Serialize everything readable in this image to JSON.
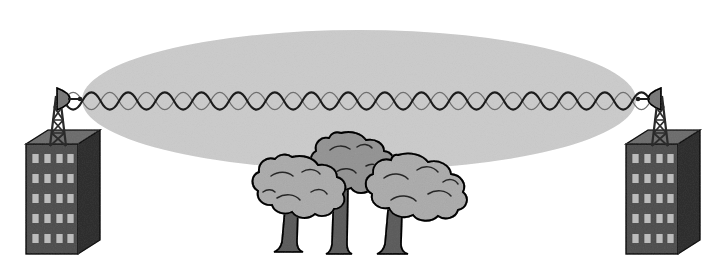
{
  "diagram": {
    "type": "technical-illustration",
    "canvas": {
      "width": 718,
      "height": 280,
      "background": "#ffffff"
    },
    "colors": {
      "background": "#ffffff",
      "fresnel_fill": "#e4e4e4",
      "building_front": "#8f8f8f",
      "building_side": "#6e6e6e",
      "building_top": "#a8a8a8",
      "building_outline": "#3a3a3a",
      "window_light": "#c9c9c9",
      "window_dark": "#5e5e5e",
      "tower_dark": "#2b2b2b",
      "tower_fill": "#8a8a8a",
      "dish_fill": "#b0b0b0",
      "wave_dark": "#1c1c1c",
      "wave_light": "#6f6f6f",
      "canopy_fill": "#d2d2d2",
      "canopy_fill_alt": "#c3c3c3",
      "trunk_fill": "#9a9a9a",
      "outline": "#262626"
    },
    "fresnel_zone": {
      "label": "fresnel-zone-ellipse",
      "center_x": 359,
      "center_y": 100,
      "radius_x": 277,
      "radius_y": 70,
      "fill": "#e4e4e4",
      "stroke": "none"
    },
    "signal_wave": {
      "label": "double-helix-signal",
      "start_x": 64,
      "end_x": 654,
      "axis_y": 101,
      "amplitude": 11,
      "cycles": 24,
      "stroke_dark": "#1c1c1c",
      "stroke_light": "#6f6f6f",
      "stroke_width_dark": 2.1,
      "stroke_width_light": 1.2,
      "phase_offset_degrees": 180
    },
    "towers": [
      {
        "id": "tower-left",
        "side": "left",
        "base_x": 58,
        "base_y": 146,
        "top_y": 96,
        "segments": 3,
        "dish_direction": "right",
        "dish_x": 68,
        "dish_y": 98
      },
      {
        "id": "tower-right",
        "side": "right",
        "base_x": 660,
        "base_y": 146,
        "top_y": 96,
        "segments": 3,
        "dish_direction": "left",
        "dish_x": 650,
        "dish_y": 98
      }
    ],
    "buildings": [
      {
        "id": "building-left",
        "side": "left",
        "x": 26,
        "y": 144,
        "front_width": 52,
        "height": 110,
        "depth": 22,
        "window_columns": 4,
        "window_rows": 5
      },
      {
        "id": "building-right",
        "side": "right",
        "x": 626,
        "y": 144,
        "front_width": 52,
        "height": 110,
        "depth": 22,
        "window_columns": 4,
        "window_rows": 5
      }
    ],
    "trees": [
      {
        "id": "tree-center-back",
        "order": 1,
        "center_x": 342,
        "canopy_y": 166,
        "canopy_rx": 48,
        "canopy_ry": 34,
        "trunk_top": 190,
        "trunk_bottom": 256,
        "trunk_width": 17,
        "canopy_fill": "#c3c3c3"
      },
      {
        "id": "tree-left-front",
        "order": 2,
        "center_x": 292,
        "canopy_y": 190,
        "canopy_rx": 50,
        "canopy_ry": 33,
        "trunk_top": 212,
        "trunk_bottom": 253,
        "trunk_width": 16,
        "canopy_fill": "#d2d2d2"
      },
      {
        "id": "tree-right-front",
        "order": 3,
        "center_x": 395,
        "canopy_y": 191,
        "canopy_rx": 55,
        "canopy_ry": 34,
        "trunk_top": 214,
        "trunk_bottom": 255,
        "trunk_width": 17,
        "canopy_fill": "#d2d2d2"
      }
    ],
    "legend_text": {
      "scene_description": "Two rooftop microwave towers transmit a radio signal across a Fresnel zone partially blocked by a cluster of three trees."
    }
  }
}
